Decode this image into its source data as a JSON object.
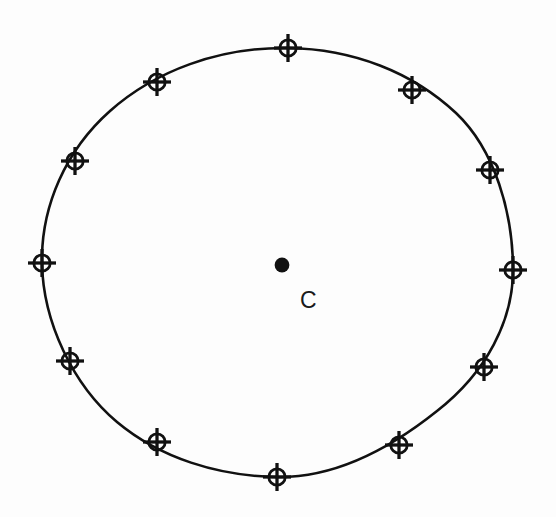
{
  "figure": {
    "background_color": "#fdfdfd",
    "stroke_color": "#111111",
    "center_label": "C"
  },
  "chart_data": {
    "type": "scatter",
    "xlabel": "",
    "ylabel": "",
    "grid": false,
    "legend": null,
    "xlim": [
      0,
      556
    ],
    "ylim": [
      517,
      0
    ],
    "annotations": [
      {
        "text": "C",
        "x": 309,
        "y": 299,
        "describes": "center-point"
      }
    ],
    "series": [
      {
        "name": "center-point",
        "marker": "filled-dot",
        "count": 1,
        "points": [
          {
            "label": "C",
            "x": 282,
            "y": 265
          }
        ]
      },
      {
        "name": "circumference-points",
        "marker": "crosshair-circle",
        "count": 12,
        "points": [
          {
            "index": 1,
            "angle_deg": 90,
            "x": 288,
            "y": 48
          },
          {
            "index": 2,
            "angle_deg": 60,
            "x": 412,
            "y": 90
          },
          {
            "index": 3,
            "angle_deg": 30,
            "x": 490,
            "y": 170
          },
          {
            "index": 4,
            "angle_deg": 0,
            "x": 513,
            "y": 270
          },
          {
            "index": 5,
            "angle_deg": 330,
            "x": 484,
            "y": 367
          },
          {
            "index": 6,
            "angle_deg": 300,
            "x": 399,
            "y": 445
          },
          {
            "index": 7,
            "angle_deg": 270,
            "x": 277,
            "y": 477
          },
          {
            "index": 8,
            "angle_deg": 240,
            "x": 157,
            "y": 442
          },
          {
            "index": 9,
            "angle_deg": 210,
            "x": 70,
            "y": 361
          },
          {
            "index": 10,
            "angle_deg": 180,
            "x": 42,
            "y": 263
          },
          {
            "index": 11,
            "angle_deg": 150,
            "x": 75,
            "y": 161
          },
          {
            "index": 12,
            "angle_deg": 120,
            "x": 157,
            "y": 82
          }
        ]
      }
    ],
    "shapes": [
      {
        "name": "main-circle",
        "type": "ellipse",
        "cx": 277.5,
        "cy": 262,
        "rx": 235,
        "ry": 214,
        "stroke": "#111111",
        "stroke_width": 2.6,
        "fill": "none"
      }
    ]
  }
}
